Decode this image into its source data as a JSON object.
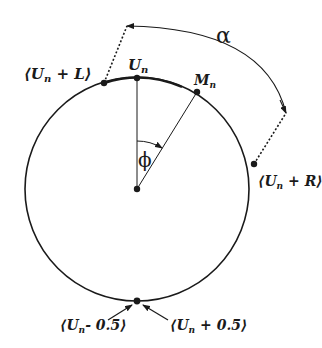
{
  "diagram": {
    "type": "circle-angle-diagram",
    "colors": {
      "stroke": "#1a1a1a",
      "background": "#ffffff"
    },
    "labels": {
      "top_point": "U",
      "top_point_sub": "n",
      "mean_point": "M",
      "mean_point_sub": "n",
      "left_point_open": "⟨U",
      "left_point_sub": "n",
      "left_point_close": " + L⟩",
      "right_point_open": "⟨U",
      "right_point_sub": "n",
      "right_point_close": " + R⟩",
      "bottom_left_open": "⟨U",
      "bottom_left_sub": "n",
      "bottom_left_close": "- 0.5⟩",
      "bottom_right_open": "⟨U",
      "bottom_right_sub": "n",
      "bottom_right_close": " + 0.5⟩",
      "angle_phi": "ϕ",
      "angle_alpha": "α"
    }
  }
}
